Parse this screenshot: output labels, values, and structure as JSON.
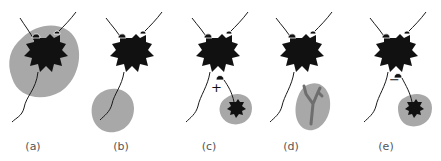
{
  "colors": {
    "cell": "#111111",
    "blob": "#a8a8a8",
    "branch": "#6e6e6e",
    "line": "#1a1a1a"
  },
  "panels": [
    {
      "id": "a",
      "label": "(a)",
      "label_x": 33,
      "annotation": ""
    },
    {
      "id": "b",
      "label": "(b)",
      "label_x": 121,
      "annotation": ""
    },
    {
      "id": "c",
      "label": "(c)",
      "label_x": 209,
      "annotation": "+"
    },
    {
      "id": "d",
      "label": "(d)",
      "label_x": 291,
      "annotation": ""
    },
    {
      "id": "e",
      "label": "(e)",
      "label_x": 386,
      "annotation": "−"
    }
  ]
}
